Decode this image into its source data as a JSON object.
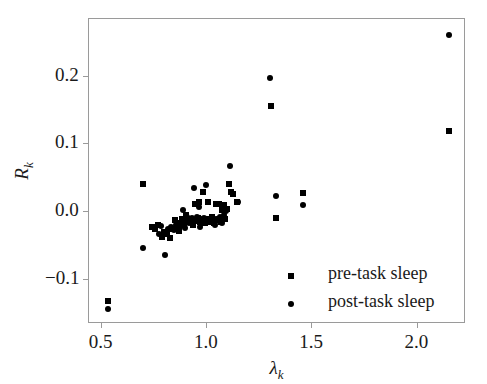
{
  "chart_data": {
    "type": "scatter",
    "title": "",
    "xlabel": "λ_k",
    "ylabel": "R_k",
    "xlabel_base": "λ",
    "xlabel_sub": "k",
    "ylabel_base": "R",
    "ylabel_sub": "k",
    "xlim": [
      0.44,
      2.23
    ],
    "ylim": [
      -0.165,
      0.285
    ],
    "xticks": [
      0.5,
      1.0,
      1.5,
      2.0
    ],
    "xtick_labels": [
      "0.5",
      "1.0",
      "1.5",
      "2.0"
    ],
    "yticks": [
      -0.1,
      0.0,
      0.1,
      0.2
    ],
    "ytick_labels": [
      "−0.1",
      "0.0",
      "0.1",
      "0.2"
    ],
    "grid": false,
    "legend_position": "lower right",
    "marker_color": "#000000",
    "frame_color": "#9a9a9a",
    "series": [
      {
        "name": "pre-task sleep",
        "marker": "square",
        "color": "#000000",
        "points": [
          [
            0.533,
            -0.133
          ],
          [
            0.701,
            0.04
          ],
          [
            0.742,
            -0.023
          ],
          [
            0.757,
            -0.026
          ],
          [
            0.772,
            -0.02
          ],
          [
            0.789,
            -0.038
          ],
          [
            0.8,
            -0.03
          ],
          [
            0.815,
            -0.034
          ],
          [
            0.828,
            -0.04
          ],
          [
            0.84,
            -0.026
          ],
          [
            0.851,
            -0.013
          ],
          [
            0.862,
            -0.024
          ],
          [
            0.871,
            -0.029
          ],
          [
            0.88,
            -0.018
          ],
          [
            0.888,
            -0.011
          ],
          [
            0.896,
            -0.02
          ],
          [
            0.903,
            -0.006
          ],
          [
            0.912,
            -0.014
          ],
          [
            0.921,
            -0.016
          ],
          [
            0.93,
            -0.012
          ],
          [
            0.938,
            -0.02
          ],
          [
            0.946,
            0.01
          ],
          [
            0.953,
            -0.014
          ],
          [
            0.96,
            -0.01
          ],
          [
            0.967,
            0.013
          ],
          [
            0.974,
            -0.016
          ],
          [
            0.98,
            -0.013
          ],
          [
            0.988,
            0.028
          ],
          [
            0.995,
            -0.017
          ],
          [
            1.001,
            -0.012
          ],
          [
            1.008,
            0.014
          ],
          [
            1.015,
            -0.016
          ],
          [
            1.022,
            -0.013
          ],
          [
            1.029,
            -0.009
          ],
          [
            1.036,
            -0.017
          ],
          [
            1.043,
            -0.013
          ],
          [
            1.05,
            0.011
          ],
          [
            1.057,
            -0.013
          ],
          [
            1.063,
            0.01
          ],
          [
            1.07,
            -0.016
          ],
          [
            1.077,
            0.001
          ],
          [
            1.084,
            0.009
          ],
          [
            1.091,
            -0.012
          ],
          [
            1.099,
            0.003
          ],
          [
            1.108,
            0.04
          ],
          [
            1.118,
            0.028
          ],
          [
            1.13,
            0.026
          ],
          [
            1.148,
            0.013
          ],
          [
            1.308,
            0.155
          ],
          [
            1.333,
            -0.01
          ],
          [
            1.46,
            0.027
          ],
          [
            2.152,
            0.118
          ]
        ]
      },
      {
        "name": "post-task sleep",
        "marker": "circle",
        "color": "#000000",
        "points": [
          [
            0.533,
            -0.145
          ],
          [
            0.7,
            -0.055
          ],
          [
            0.76,
            -0.025
          ],
          [
            0.775,
            -0.033
          ],
          [
            0.788,
            -0.022
          ],
          [
            0.805,
            -0.065
          ],
          [
            0.82,
            -0.026
          ],
          [
            0.836,
            -0.024
          ],
          [
            0.848,
            -0.028
          ],
          [
            0.858,
            -0.021
          ],
          [
            0.868,
            -0.019
          ],
          [
            0.878,
            -0.022
          ],
          [
            0.89,
            0.002
          ],
          [
            0.9,
            -0.025
          ],
          [
            0.91,
            -0.008
          ],
          [
            0.918,
            -0.018
          ],
          [
            0.926,
            -0.015
          ],
          [
            0.934,
            -0.01
          ],
          [
            0.942,
            0.034
          ],
          [
            0.95,
            -0.014
          ],
          [
            0.958,
            -0.008
          ],
          [
            0.965,
            0.006
          ],
          [
            0.972,
            -0.024
          ],
          [
            0.979,
            -0.011
          ],
          [
            0.986,
            -0.015
          ],
          [
            0.993,
            -0.01
          ],
          [
            1.0,
            0.038
          ],
          [
            1.007,
            -0.012
          ],
          [
            1.014,
            -0.011
          ],
          [
            1.021,
            -0.014
          ],
          [
            1.028,
            -0.01
          ],
          [
            1.035,
            -0.013
          ],
          [
            1.042,
            -0.02
          ],
          [
            1.049,
            -0.011
          ],
          [
            1.056,
            -0.012
          ],
          [
            1.062,
            -0.015
          ],
          [
            1.069,
            -0.009
          ],
          [
            1.076,
            -0.018
          ],
          [
            1.086,
            -0.006
          ],
          [
            1.094,
            0.0
          ],
          [
            1.112,
            0.067
          ],
          [
            1.152,
            0.013
          ],
          [
            1.305,
            0.197
          ],
          [
            1.333,
            0.022
          ],
          [
            1.46,
            0.009
          ],
          [
            2.152,
            0.26
          ]
        ]
      }
    ]
  },
  "legend": {
    "entries": [
      {
        "label": "pre-task sleep",
        "marker": "square"
      },
      {
        "label": "post-task sleep",
        "marker": "circle"
      }
    ]
  }
}
